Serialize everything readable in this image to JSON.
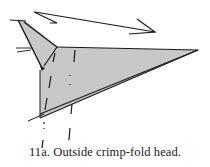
{
  "figure": {
    "step_number": "11a.",
    "caption": "11a.  Outside crimp-fold head.",
    "colors": {
      "paper_fill": "#c8c8c8",
      "line": "#1a1a1a",
      "background": "#ffffff"
    },
    "elements": [
      "body-triangle",
      "head-flap",
      "motion-arrow",
      "valley-fold-line-left",
      "valley-fold-line-right",
      "crimp-motion-marks"
    ]
  }
}
